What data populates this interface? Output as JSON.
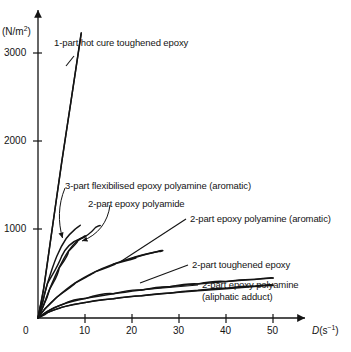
{
  "chart_data": {
    "type": "line",
    "title": "",
    "xlabel": "D(s⁻¹)",
    "ylabel": "(N/m²)",
    "xlim": [
      0,
      57
    ],
    "ylim": [
      0,
      3400
    ],
    "xticks": [
      0,
      10,
      20,
      30,
      40,
      50
    ],
    "yticks": [
      1000,
      2000,
      3000
    ],
    "grid": false,
    "legend_position": "inline-annotations",
    "series": [
      {
        "name": "1-part hot cure toughened epoxy",
        "points": [
          [
            0,
            0
          ],
          [
            1.2,
            330
          ],
          [
            3.0,
            1000
          ],
          [
            5.0,
            1750
          ],
          [
            7.0,
            2450
          ],
          [
            9.2,
            3230
          ]
        ]
      },
      {
        "name": "3-part flexibilised epoxy polyamine (aromatic)",
        "points": [
          [
            0,
            0
          ],
          [
            0.8,
            140
          ],
          [
            2.0,
            390
          ],
          [
            4.0,
            700
          ],
          [
            6.0,
            900
          ],
          [
            8.0,
            1010
          ],
          [
            9.0,
            1050
          ]
        ]
      },
      {
        "name": "2-part epoxy polyamide",
        "points": [
          [
            0,
            0
          ],
          [
            1.0,
            120
          ],
          [
            2.5,
            330
          ],
          [
            4.5,
            570
          ],
          [
            6.5,
            760
          ],
          [
            8.5,
            880
          ],
          [
            10.0,
            930
          ]
        ]
      },
      {
        "name": "2-part epoxy polyamine (aromatic)",
        "points": [
          [
            0,
            0
          ],
          [
            1.5,
            105
          ],
          [
            4,
            235
          ],
          [
            8,
            400
          ],
          [
            12,
            520
          ],
          [
            16,
            610
          ],
          [
            20,
            680
          ],
          [
            24,
            735
          ],
          [
            26,
            755
          ]
        ]
      },
      {
        "name": "2-part toughened epoxy",
        "points": [
          [
            0,
            0
          ],
          [
            2,
            75
          ],
          [
            5,
            150
          ],
          [
            10,
            220
          ],
          [
            16,
            275
          ],
          [
            22,
            318
          ],
          [
            28,
            355
          ],
          [
            34,
            385
          ],
          [
            40,
            412
          ],
          [
            46,
            437
          ],
          [
            50,
            452
          ]
        ]
      },
      {
        "name": "2-part epoxy polyamine (aliphatic adduct)",
        "points": [
          [
            0,
            0
          ],
          [
            2,
            60
          ],
          [
            5,
            120
          ],
          [
            10,
            175
          ],
          [
            16,
            218
          ],
          [
            22,
            252
          ],
          [
            28,
            282
          ],
          [
            34,
            308
          ],
          [
            40,
            332
          ],
          [
            46,
            356
          ],
          [
            50,
            370
          ]
        ]
      }
    ]
  },
  "axes": {
    "y_axis_label": "(N/m",
    "y_axis_label_sup": "2",
    "y_axis_label_close": ")",
    "x_axis_label_var": "D",
    "x_axis_label_unit": "(s",
    "x_axis_label_sup": "−1",
    "x_axis_label_close": ")",
    "ytick_3000": "3000",
    "ytick_2000": "2000",
    "ytick_1000": "1000",
    "xtick_0": "0",
    "xtick_10": "10",
    "xtick_20": "20",
    "xtick_30": "30",
    "xtick_40": "40",
    "xtick_50": "50"
  },
  "annotations": {
    "label_1part_hot_cure": "1-part hot cure toughened epoxy",
    "label_3part_flexibilised": "3-part flexibilised epoxy polyamine (aromatic)",
    "label_2part_polyamide": "2-part epoxy polyamide",
    "label_2part_polyamine_aromatic": "2-part epoxy polyamine (aromatic)",
    "label_2part_toughened": "2-part toughened epoxy",
    "label_2part_polyamine_aliphatic_l1": "2-part epoxy polyamine",
    "label_2part_polyamine_aliphatic_l2": "(aliphatic adduct)"
  },
  "colors": {
    "ink": "#141414",
    "background": "#ffffff"
  }
}
